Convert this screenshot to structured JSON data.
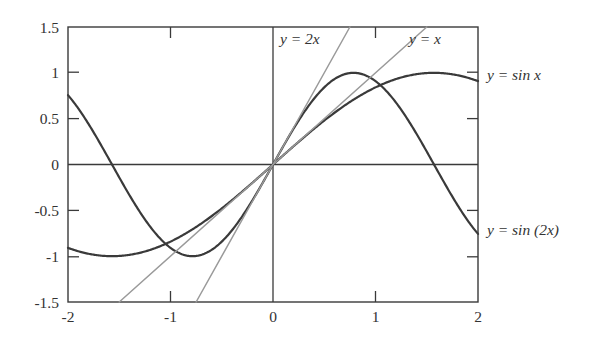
{
  "chart_data": {
    "type": "line",
    "title": "",
    "xlabel": "",
    "ylabel": "",
    "xlim": [
      -2,
      2
    ],
    "ylim": [
      -1.5,
      1.5
    ],
    "grid": false,
    "legend_position": "inline-annotations",
    "x_ticks": [
      "-2",
      "-1",
      "0",
      "1",
      "2"
    ],
    "x_tick_values": [
      -2,
      -1,
      0,
      1,
      2
    ],
    "y_ticks": [
      "1.5",
      "1",
      "0.5",
      "0",
      "-0.5",
      "-1",
      "-1.5"
    ],
    "y_tick_values": [
      1.5,
      1,
      0.5,
      0,
      -0.5,
      -1,
      -1.5
    ],
    "series": [
      {
        "name": "y = sin x",
        "kind": "sine",
        "color": "#3a3a3a",
        "width": 2.2,
        "formula": "sin(x)",
        "x": [
          -2.0,
          -1.75,
          -1.5,
          -1.25,
          -1.0,
          -0.75,
          -0.5,
          -0.25,
          0.0,
          0.25,
          0.5,
          0.75,
          1.0,
          1.25,
          1.5,
          1.75,
          2.0
        ],
        "values": [
          -0.909,
          -0.984,
          -0.997,
          -0.949,
          -0.841,
          -0.682,
          -0.479,
          -0.247,
          0.0,
          0.247,
          0.479,
          0.682,
          0.841,
          0.949,
          0.997,
          0.984,
          0.909
        ]
      },
      {
        "name": "y = sin (2x)",
        "kind": "sine2",
        "color": "#3a3a3a",
        "width": 2.2,
        "formula": "sin(2x)",
        "x": [
          -2.0,
          -1.75,
          -1.5,
          -1.25,
          -1.0,
          -0.75,
          -0.5,
          -0.25,
          0.0,
          0.25,
          0.5,
          0.75,
          1.0,
          1.25,
          1.5,
          1.75,
          2.0
        ],
        "values": [
          0.757,
          0.708,
          -0.141,
          -0.599,
          -0.909,
          -0.997,
          -0.841,
          -0.479,
          0.0,
          0.479,
          0.841,
          0.997,
          0.909,
          0.599,
          0.141,
          -0.708,
          -0.757
        ]
      },
      {
        "name": "y = x",
        "kind": "line",
        "color": "#9a9a9a",
        "width": 1.5,
        "formula": "x",
        "x": [
          -1.5,
          1.5
        ],
        "values": [
          -1.5,
          1.5
        ]
      },
      {
        "name": "y = 2x",
        "kind": "line",
        "color": "#9a9a9a",
        "width": 1.5,
        "formula": "2x",
        "x": [
          -0.75,
          0.75
        ],
        "values": [
          -1.5,
          1.5
        ]
      }
    ],
    "annotations": [
      {
        "id": "label-y-2x",
        "text": "y = 2x",
        "x_px": 280,
        "y_px": 44
      },
      {
        "id": "label-y-x",
        "text": "y = x",
        "x_px": 409,
        "y_px": 44
      },
      {
        "id": "label-y-sin-x",
        "text": "y = sin x",
        "x_px": 487,
        "y_px": 80
      },
      {
        "id": "label-y-sin-2x",
        "text": "y = sin (2x)",
        "x_px": 487,
        "y_px": 235
      }
    ]
  },
  "labels": {
    "y_2x": "y = 2x",
    "y_x": "y = x",
    "y_sin_x": "y = sin x",
    "y_sin_2x": "y = sin (2x)"
  },
  "axis": {
    "x": {
      "t0": "-2",
      "t1": "-1",
      "t2": "0",
      "t3": "1",
      "t4": "2"
    },
    "y": {
      "t0": "1.5",
      "t1": "1",
      "t2": "0.5",
      "t3": "0",
      "t4": "-0.5",
      "t5": "-1",
      "t6": "-1.5"
    }
  },
  "colors": {
    "curve": "#3a3a3a",
    "straight_line": "#9a9a9a",
    "frame": "#3a3a3a",
    "text": "#333333",
    "background": "#ffffff"
  }
}
